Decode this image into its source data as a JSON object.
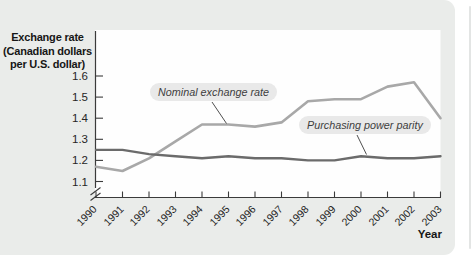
{
  "chart_data": {
    "type": "line",
    "title": "Exchange rate (Canadian dollars per U.S. dollar)",
    "ylabel_lines": [
      "Exchange rate",
      "(Canadian dollars",
      "per U.S. dollar)"
    ],
    "xlabel": "Year",
    "x": [
      1990,
      1991,
      1992,
      1993,
      1994,
      1995,
      1996,
      1997,
      1998,
      1999,
      2000,
      2001,
      2002,
      2003
    ],
    "series": [
      {
        "name": "Nominal exchange rate",
        "color": "#a8a8a8",
        "values": [
          1.17,
          1.15,
          1.21,
          1.29,
          1.37,
          1.37,
          1.36,
          1.38,
          1.48,
          1.49,
          1.49,
          1.55,
          1.57,
          1.4
        ]
      },
      {
        "name": "Purchasing power parity",
        "color": "#6b6b6b",
        "values": [
          1.25,
          1.25,
          1.23,
          1.22,
          1.21,
          1.22,
          1.21,
          1.21,
          1.2,
          1.2,
          1.22,
          1.21,
          1.21,
          1.22
        ]
      }
    ],
    "y_ticks": [
      1.1,
      1.2,
      1.3,
      1.4,
      1.5,
      1.6
    ],
    "ylim": [
      1.05,
      1.65
    ],
    "axis_break": true,
    "grid": "off",
    "legend_position": "inline-labels",
    "colors": {
      "background": "#eaecea",
      "plot_background": "#fefefe",
      "axis": "#3b3b3b",
      "label_pill": "#e9e9e9"
    }
  }
}
